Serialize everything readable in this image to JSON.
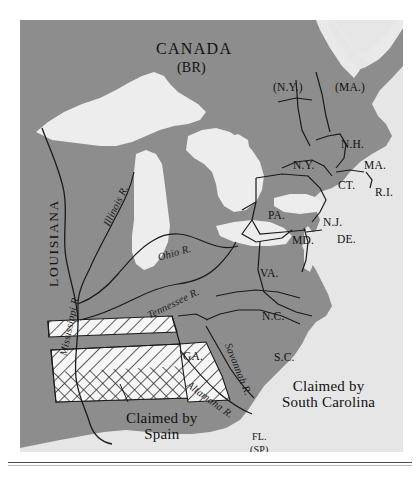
{
  "map": {
    "title": "CANADA",
    "title_sub": "(BR)",
    "region_left": "LOUISIANA",
    "colors": {
      "land": "#8d8d8d",
      "water": "#e9e9e9",
      "ocean": "#e6e6e6",
      "lakes": "#ededed",
      "outline": "#1a1a1a",
      "hatch": "#f4f4f4",
      "page": "#ffffff"
    },
    "states": [
      {
        "id": "ny-claim",
        "label": "(N.Y.)",
        "x": 253,
        "y": 61,
        "cls": "lbl-state"
      },
      {
        "id": "ma-claim",
        "label": "(MA.)",
        "x": 315,
        "y": 61,
        "cls": "lbl-state"
      },
      {
        "id": "nh",
        "label": "N.H.",
        "x": 321,
        "y": 118,
        "cls": "lbl-state"
      },
      {
        "id": "ny",
        "label": "N.Y.",
        "x": 273,
        "y": 139,
        "cls": "lbl-state"
      },
      {
        "id": "ma",
        "label": "MA.",
        "x": 344,
        "y": 139,
        "cls": "lbl-state"
      },
      {
        "id": "ct",
        "label": "CT.",
        "x": 318,
        "y": 159,
        "cls": "lbl-state"
      },
      {
        "id": "ri",
        "label": "R.I.",
        "x": 355,
        "y": 166,
        "cls": "lbl-state"
      },
      {
        "id": "pa",
        "label": "PA.",
        "x": 248,
        "y": 189,
        "cls": "lbl-state"
      },
      {
        "id": "nj",
        "label": "N.J.",
        "x": 303,
        "y": 196,
        "cls": "lbl-state"
      },
      {
        "id": "md",
        "label": "MD.",
        "x": 272,
        "y": 214,
        "cls": "lbl-state"
      },
      {
        "id": "de",
        "label": "DE.",
        "x": 317,
        "y": 213,
        "cls": "lbl-state"
      },
      {
        "id": "va",
        "label": "VA.",
        "x": 240,
        "y": 247,
        "cls": "lbl-state"
      },
      {
        "id": "nc",
        "label": "N.C.",
        "x": 242,
        "y": 290,
        "cls": "lbl-state"
      },
      {
        "id": "sc",
        "label": "S.C.",
        "x": 254,
        "y": 331,
        "cls": "lbl-state"
      },
      {
        "id": "ga",
        "label": "GA.",
        "x": 163,
        "y": 330,
        "cls": "lbl-state"
      },
      {
        "id": "fl",
        "label": "FL.",
        "x": 232,
        "y": 411,
        "cls": "lbl-small"
      },
      {
        "id": "fl-sp",
        "label": "(SP)",
        "x": 230,
        "y": 424,
        "cls": "lbl-small"
      }
    ],
    "rivers": [
      {
        "id": "illinois",
        "label": "Illinois R.",
        "x": 86,
        "y": 200,
        "rot": -64
      },
      {
        "id": "ohio",
        "label": "Ohio R.",
        "x": 138,
        "y": 232,
        "rot": -16
      },
      {
        "id": "tennessee",
        "label": "Tennessee R.",
        "x": 128,
        "y": 290,
        "rot": -26
      },
      {
        "id": "mississippi",
        "label": "Mississippi R.",
        "x": 43,
        "y": 330,
        "rot": -78
      },
      {
        "id": "savannah",
        "label": "Savannah R.",
        "x": 208,
        "y": 318,
        "rot": 68
      },
      {
        "id": "altamaha",
        "label": "Altamaha R.",
        "x": 168,
        "y": 358,
        "rot": 36
      }
    ],
    "claims": [
      {
        "id": "claim-sc",
        "line1": "Claimed by",
        "line2": "South Carolina",
        "x": 272,
        "y": 366
      },
      {
        "id": "claim-spain",
        "line1": "Claimed by",
        "line2": "Spain",
        "x": 125,
        "y": 399
      }
    ]
  }
}
